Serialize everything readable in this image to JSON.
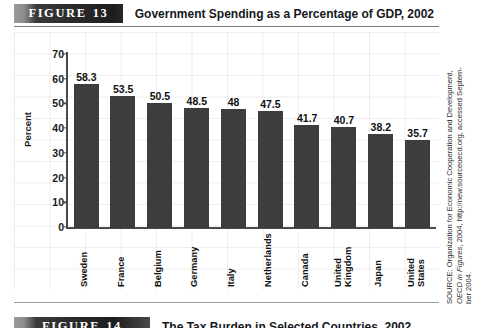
{
  "figure": {
    "banner_word": "FIGURE",
    "banner_number": "13",
    "title": "Government Spending as a Percentage of GDP, 2002"
  },
  "source": {
    "line1": "SOURCE: Organization for Economic Cooperation and Development,",
    "line2_pre": "OECD in Figures",
    "line2_post": ", 2004, http://new.sourceoecd.org, accessed Septem-",
    "line3": "ber 2004."
  },
  "next_figure": {
    "banner_word": "FIGURE",
    "banner_number": "14",
    "title": "The Tax Burden in Selected Countries, 2002"
  },
  "chart_data": {
    "type": "bar",
    "title": "Government Spending as a Percentage of GDP, 2002",
    "xlabel": "",
    "ylabel": "Percent",
    "ylim": [
      0,
      70
    ],
    "yticks": [
      0,
      10,
      20,
      30,
      40,
      50,
      60,
      70
    ],
    "ytick_labels": [
      "0",
      "10",
      "20",
      "30",
      "40",
      "50",
      "60",
      "70"
    ],
    "grid": true,
    "legend": "none",
    "bar_color": "#3d3d3d",
    "categories": [
      "Sweden",
      "France",
      "Belgium",
      "Germany",
      "Italy",
      "Netherlands",
      "Canada",
      "United Kingdom",
      "Japan",
      "United States"
    ],
    "category_lines": [
      [
        "Sweden"
      ],
      [
        "France"
      ],
      [
        "Belgium"
      ],
      [
        "Germany"
      ],
      [
        "Italy"
      ],
      [
        "Netherlands"
      ],
      [
        "Canada"
      ],
      [
        "United",
        "Kingdom"
      ],
      [
        "Japan"
      ],
      [
        "United",
        "States"
      ]
    ],
    "values": [
      58.3,
      53.5,
      50.5,
      48.5,
      48,
      47.5,
      41.7,
      40.7,
      38.2,
      35.7
    ],
    "value_labels": [
      "58.3",
      "53.5",
      "50.5",
      "48.5",
      "48",
      "47.5",
      "41.7",
      "40.7",
      "38.2",
      "35.7"
    ]
  }
}
